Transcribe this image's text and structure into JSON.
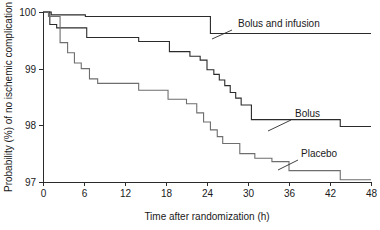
{
  "figure": {
    "width": 380,
    "height": 230,
    "background": "#ffffff"
  },
  "chart_data": {
    "type": "line",
    "title": "",
    "subtitle": "",
    "xlabel": "Time after randomization (h)",
    "ylabel": "Probability (%) of no ischemic complication",
    "xlim": [
      0,
      48
    ],
    "ylim": [
      97,
      100
    ],
    "xticks": [
      0,
      6,
      12,
      18,
      24,
      30,
      36,
      42,
      48
    ],
    "xticklabels": [
      "0",
      "6",
      "12",
      "18",
      "24",
      "30",
      "36",
      "42",
      "48"
    ],
    "yticks": [
      97,
      98,
      99,
      100
    ],
    "yticklabels": [
      "97",
      "98",
      "99",
      "100"
    ],
    "grid": false,
    "legend_position": "inline-annotations",
    "step_style": "post",
    "annotations": [
      {
        "text": "Bolus and infusion",
        "label_x": 238,
        "label_y": 27,
        "leader_from_x": 232,
        "leader_from_y": 30,
        "leader_to_x": 212,
        "leader_to_y": 39
      },
      {
        "text": "Bolus",
        "label_x": 295,
        "label_y": 117,
        "leader_from_x": 291,
        "leader_from_y": 120,
        "leader_to_x": 268,
        "leader_to_y": 131
      },
      {
        "text": "Placebo",
        "label_x": 301,
        "label_y": 157,
        "leader_from_x": 298,
        "leader_from_y": 160,
        "leader_to_x": 278,
        "leader_to_y": 170
      }
    ],
    "series": [
      {
        "name": "Bolus and infusion",
        "color": "#2b2b2b",
        "x": [
          0,
          1.2,
          1.2,
          6.2,
          6.2,
          24.5,
          24.5,
          48
        ],
        "y": [
          100.0,
          100.0,
          99.95,
          99.95,
          99.92,
          99.92,
          99.62,
          99.62
        ]
      },
      {
        "name": "Bolus",
        "color": "#2b2b2b",
        "x": [
          0,
          1.0,
          1.0,
          2.0,
          2.0,
          6.4,
          6.4,
          14.0,
          14.0,
          18.5,
          18.5,
          21.5,
          21.5,
          23.0,
          23.0,
          24.0,
          24.0,
          25.0,
          25.0,
          25.8,
          25.8,
          26.6,
          26.6,
          27.4,
          27.4,
          28.2,
          28.2,
          29.0,
          29.0,
          30.5,
          30.5,
          43.5,
          43.5,
          48
        ],
        "y": [
          100.0,
          100.0,
          99.78,
          99.78,
          99.72,
          99.72,
          99.55,
          99.55,
          99.48,
          99.48,
          99.3,
          99.3,
          99.22,
          99.22,
          99.15,
          99.15,
          98.98,
          98.98,
          98.9,
          98.9,
          98.8,
          98.8,
          98.7,
          98.7,
          98.58,
          98.58,
          98.48,
          98.48,
          98.36,
          98.36,
          98.1,
          98.1,
          97.98,
          97.98
        ]
      },
      {
        "name": "Placebo",
        "color": "#6e6e6e",
        "x": [
          0,
          0.8,
          0.8,
          2.5,
          2.5,
          3.6,
          3.6,
          4.6,
          4.6,
          5.6,
          5.6,
          6.8,
          6.8,
          8.0,
          8.0,
          14.0,
          14.0,
          18.3,
          18.3,
          21.0,
          21.0,
          22.5,
          22.5,
          23.5,
          23.5,
          24.5,
          24.5,
          25.5,
          25.5,
          26.3,
          26.3,
          28.8,
          28.8,
          31.0,
          31.0,
          33.5,
          33.5,
          36.0,
          36.0,
          43.5,
          43.5,
          48
        ],
        "y": [
          100.0,
          100.0,
          99.92,
          99.92,
          99.46,
          99.46,
          99.28,
          99.28,
          99.1,
          99.1,
          99.0,
          99.0,
          98.82,
          98.82,
          98.74,
          98.74,
          98.62,
          98.62,
          98.46,
          98.46,
          98.38,
          98.38,
          98.22,
          98.22,
          98.06,
          98.06,
          97.92,
          97.92,
          97.8,
          97.8,
          97.68,
          97.68,
          97.5,
          97.5,
          97.42,
          97.42,
          97.36,
          97.36,
          97.2,
          97.2,
          97.04,
          97.04
        ]
      }
    ]
  },
  "geometry": {
    "plot_left": 43,
    "plot_right": 371,
    "plot_top": 12,
    "plot_bottom": 182,
    "tick_length": 4
  }
}
